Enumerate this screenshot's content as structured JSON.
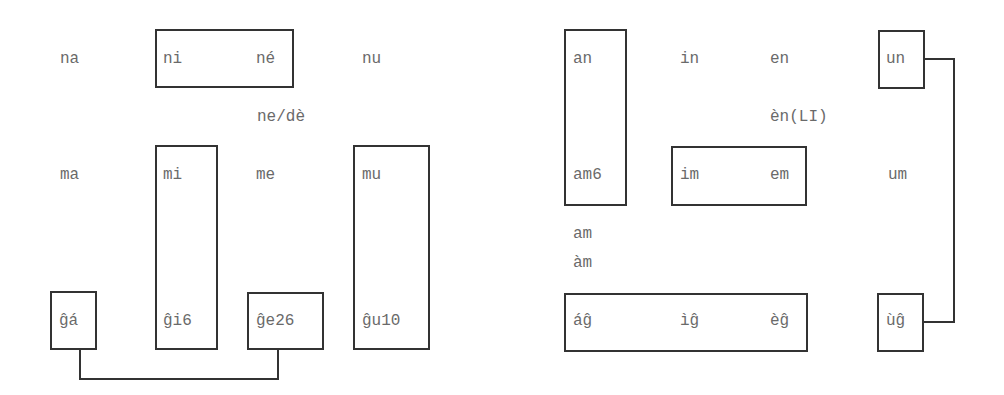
{
  "left_panel": {
    "labels": {
      "na": "na",
      "ni": "ni",
      "ne_acute": "né",
      "nu": "nu",
      "ne_de": "ne/dè",
      "ma": "ma",
      "mi": "mi",
      "me": "me",
      "mu": "mu",
      "ga": "ĝá",
      "gi6": "ĝi6",
      "ge26": "ĝe26",
      "gu10": "ĝu10"
    },
    "boxes": [
      "ni–né",
      "mi–ĝi6",
      "mu–ĝu10",
      "ĝá",
      "ĝe26"
    ],
    "connectors": [
      "ĝá–ĝe26"
    ]
  },
  "right_panel": {
    "labels": {
      "an": "an",
      "in": "in",
      "en": "en",
      "un": "un",
      "en_li": "èn(LI)",
      "am6": "am6",
      "im": "im",
      "em": "em",
      "um": "um",
      "am": "am",
      "am_grave": "àm",
      "ag": "áĝ",
      "ig": "ìĝ",
      "eg": "èĝ",
      "ug": "ùĝ"
    },
    "boxes": [
      "an–am6",
      "im–em",
      "un",
      "áĝ–ìĝ–èĝ",
      "ùĝ"
    ],
    "connectors": [
      "un–ùĝ"
    ]
  },
  "colors": {
    "text": "#6a6a6a",
    "line": "#333333",
    "background": "#ffffff"
  }
}
